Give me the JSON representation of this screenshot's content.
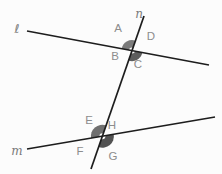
{
  "figure": {
    "background": "#fcfcfc",
    "line_color": "#1d1d1d",
    "line_width": 1.7,
    "angle_label_color": "#8d8d8d",
    "line_label_color": "#7a7a7a",
    "lines": [
      {
        "id": "l",
        "x1": 27,
        "y1": 31,
        "x2": 209,
        "y2": 65
      },
      {
        "id": "m",
        "x1": 27,
        "y1": 149,
        "x2": 215,
        "y2": 117
      },
      {
        "id": "n",
        "x1": 144,
        "y1": 16,
        "x2": 91,
        "y2": 169
      }
    ],
    "wedges": [
      {
        "id": "angle-A-sector",
        "cx": 132.0,
        "cy": 50.6,
        "r": 10.5,
        "start_deg": 190.6,
        "end_deg": 289.1,
        "color": "#7b7b7b"
      },
      {
        "id": "angle-C-sector",
        "cx": 132.0,
        "cy": 50.6,
        "r": 10.5,
        "start_deg": 10.6,
        "end_deg": 109.1,
        "color": "#5d5d5d"
      },
      {
        "id": "angle-E-sector",
        "cx": 102.4,
        "cy": 136.2,
        "r": 11.5,
        "start_deg": 170.3,
        "end_deg": 289.1,
        "color": "#6f6f6f"
      },
      {
        "id": "angle-G-sector",
        "cx": 102.4,
        "cy": 136.2,
        "r": 11.5,
        "start_deg": 350.3,
        "end_deg": 469.1,
        "color": "#525252"
      }
    ],
    "vertex_rings": [
      {
        "cx": 132.0,
        "cy": 50.6,
        "r": 3.0
      },
      {
        "cx": 102.4,
        "cy": 136.2,
        "r": 3.0
      }
    ],
    "labels": [
      {
        "id": "line-label-l",
        "text": "ℓ",
        "x": 17,
        "y": 29,
        "kind": "line"
      },
      {
        "id": "line-label-n",
        "text": "n",
        "x": 139,
        "y": 14,
        "kind": "line"
      },
      {
        "id": "line-label-m",
        "text": "m",
        "x": 17,
        "y": 151,
        "kind": "line"
      },
      {
        "id": "angle-label-A",
        "text": "A",
        "x": 118,
        "y": 29,
        "kind": "angle"
      },
      {
        "id": "angle-label-B",
        "text": "B",
        "x": 115,
        "y": 57,
        "kind": "angle"
      },
      {
        "id": "angle-label-C",
        "text": "C",
        "x": 138,
        "y": 65,
        "kind": "angle"
      },
      {
        "id": "angle-label-D",
        "text": "D",
        "x": 151,
        "y": 37,
        "kind": "angle"
      },
      {
        "id": "angle-label-E",
        "text": "E",
        "x": 89,
        "y": 121,
        "kind": "angle"
      },
      {
        "id": "angle-label-H",
        "text": "H",
        "x": 112,
        "y": 126,
        "kind": "angle"
      },
      {
        "id": "angle-label-F",
        "text": "F",
        "x": 80,
        "y": 152,
        "kind": "angle"
      },
      {
        "id": "angle-label-G",
        "text": "G",
        "x": 113,
        "y": 157,
        "kind": "angle"
      }
    ]
  }
}
